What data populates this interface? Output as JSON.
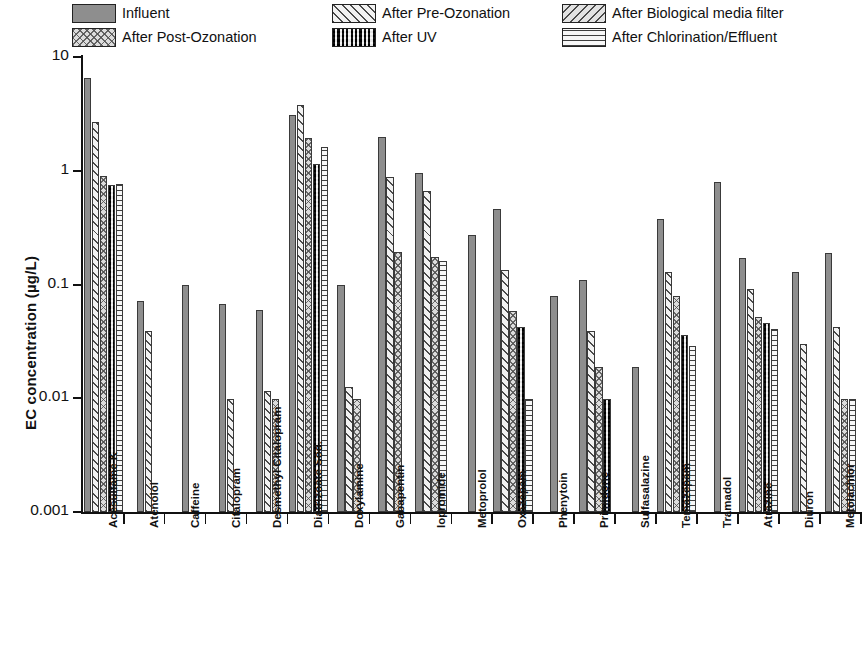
{
  "chart_data": {
    "type": "bar",
    "title": "",
    "xlabel": "",
    "ylabel": "EC concentration (µg/L)",
    "yscale": "log",
    "ylim": [
      0.001,
      10
    ],
    "ytick_labels": [
      "10",
      "1",
      "0.1",
      "0.01",
      "0.001"
    ],
    "ytick_values": [
      10,
      1,
      0.1,
      0.01,
      0.001
    ],
    "grid": false,
    "legend_position": "top",
    "legend": [
      "Influent",
      "After Pre-Ozonation",
      "After Biological media filter",
      "After Post-Ozonation",
      "After UV",
      "After Chlorination/Effluent"
    ],
    "categories": [
      "Acesulfame K",
      "Atenolol",
      "Caffeine",
      "Citalopram",
      "Desmethyl Citalopram",
      "Diatrizoate Sod.",
      "Doxylamine",
      "Gabapentin",
      "Iopromide",
      "Metoprolol",
      "Oxazepam",
      "Phenytoin",
      "Primidone",
      "Sulfasalazine",
      "Temazepam",
      "Tramadol",
      "Atrazine",
      "Diuron",
      "Metolachlor"
    ],
    "series": [
      {
        "name": "Influent",
        "key": "influent",
        "pattern": "p-influent",
        "values": [
          6.6,
          0.071,
          0.1,
          0.068,
          0.06,
          3.1,
          0.1,
          2.0,
          0.95,
          0.27,
          0.46,
          0.08,
          0.11,
          0.019,
          0.38,
          0.79,
          0.17,
          0.13,
          0.19
        ]
      },
      {
        "name": "After Pre-Ozonation",
        "key": "preoz",
        "pattern": "p-preoz",
        "values": [
          2.7,
          0.039,
          null,
          0.0098,
          0.0115,
          3.8,
          0.0125,
          0.88,
          0.66,
          null,
          0.135,
          null,
          0.039,
          null,
          0.128,
          null,
          0.092,
          0.03,
          0.042
        ]
      },
      {
        "name": "After Post-Ozonation",
        "key": "postoz",
        "pattern": "p-postoz",
        "values": [
          0.9,
          null,
          null,
          null,
          0.0099,
          1.96,
          0.0099,
          0.195,
          0.175,
          null,
          0.058,
          null,
          0.019,
          null,
          0.08,
          null,
          0.052,
          null,
          0.0099
        ]
      },
      {
        "name": "After UV",
        "key": "uv",
        "pattern": "p-uv",
        "values": [
          0.75,
          null,
          null,
          null,
          null,
          1.15,
          null,
          null,
          null,
          null,
          0.042,
          null,
          0.0099,
          null,
          0.036,
          null,
          0.046,
          null,
          null
        ]
      },
      {
        "name": "After Biological media filter",
        "key": "biofilter",
        "pattern": "p-biofilter",
        "values": [
          null,
          null,
          null,
          null,
          null,
          null,
          null,
          null,
          null,
          null,
          null,
          null,
          null,
          null,
          null,
          null,
          null,
          null,
          null
        ]
      },
      {
        "name": "After Chlorination/Effluent",
        "key": "chlor",
        "pattern": "p-chlor",
        "values": [
          0.76,
          null,
          null,
          null,
          null,
          1.62,
          null,
          null,
          0.162,
          null,
          0.0099,
          null,
          null,
          null,
          0.029,
          null,
          0.041,
          null,
          0.0099
        ]
      }
    ]
  }
}
